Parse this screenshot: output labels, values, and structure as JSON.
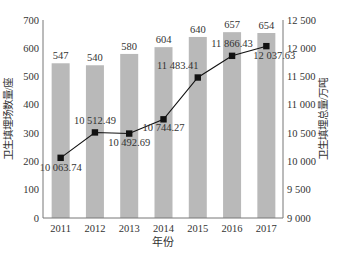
{
  "chart_data": {
    "type": "bar+line",
    "title": "",
    "xlabel": "年份",
    "ylabel_left": "卫生填埋场数量/座",
    "ylabel_right": "卫生填埋总量/万吨",
    "categories": [
      "2011",
      "2012",
      "2013",
      "2014",
      "2015",
      "2016",
      "2017"
    ],
    "series": [
      {
        "name": "卫生填埋场数量/座",
        "type": "bar",
        "axis": "left",
        "color": "#b9b9b9",
        "values": [
          547,
          540,
          580,
          604,
          640,
          657,
          654
        ],
        "labels": [
          "547",
          "540",
          "580",
          "604",
          "640",
          "657",
          "654"
        ]
      },
      {
        "name": "卫生填埋总量/万吨",
        "type": "line",
        "axis": "right",
        "color": "#111111",
        "values": [
          10063.74,
          10512.49,
          10492.69,
          10744.27,
          11483.41,
          11866.43,
          12037.63
        ],
        "labels": [
          "10 063.74",
          "10 512.49",
          "10 492.69",
          "10 744.27",
          "11 483.41",
          "11 866.43",
          "12 037.63"
        ]
      }
    ],
    "ylim_left": [
      0,
      700
    ],
    "yticks_left": [
      "0",
      "100",
      "200",
      "300",
      "400",
      "500",
      "600",
      "700"
    ],
    "ylim_right": [
      9000,
      12500
    ],
    "yticks_right": [
      "9 000",
      "9 500",
      "10 000",
      "10 500",
      "11 000",
      "11 500",
      "12 000",
      "12 500"
    ],
    "grid": false,
    "legend": false
  }
}
